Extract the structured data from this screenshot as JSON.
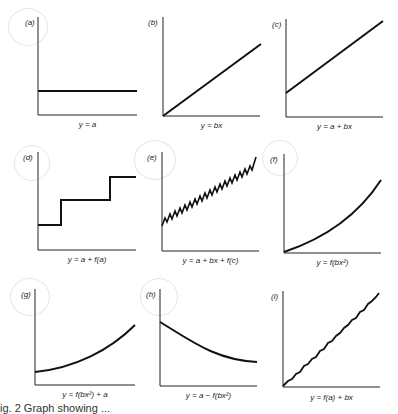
{
  "panels": [
    {
      "id": "a",
      "label": "(a)",
      "equation": "y = a"
    },
    {
      "id": "b",
      "label": "(b)",
      "equation": "y = bx"
    },
    {
      "id": "c",
      "label": "(c)",
      "equation": "y = a + bx"
    },
    {
      "id": "d",
      "label": "(d)",
      "equation": "y = a + f(a)"
    },
    {
      "id": "e",
      "label": "(e)",
      "equation": "y = a + bx + f(c)"
    },
    {
      "id": "f",
      "label": "(f)",
      "equation": "y = f(bx²)"
    },
    {
      "id": "g",
      "label": "(g)",
      "equation": "y = f(bx²) + a"
    },
    {
      "id": "h",
      "label": "(h)",
      "equation": "y = a − f(bx²)"
    },
    {
      "id": "i",
      "label": "(i)",
      "equation": "y = f(a) + bx"
    }
  ],
  "figure_caption": "ig. 2   Graph  showing ..."
}
